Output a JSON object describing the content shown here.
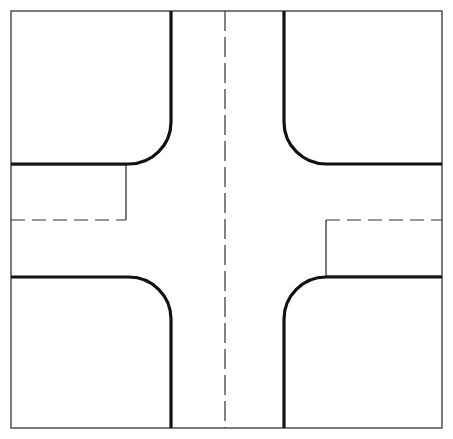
{
  "figure": {
    "type": "engineering-line-drawing",
    "canvas": {
      "width": 453,
      "height": 439
    },
    "background_color": "#ffffff",
    "symmetry": "180-degree rotational"
  },
  "style": {
    "border_color": "#444444",
    "border_width": 1.4,
    "curb_color": "#111111",
    "curb_width": 3.2,
    "thin_color": "#222222",
    "thin_width": 1.2,
    "dash_color": "#333333",
    "dash_width": 1.2,
    "dash_pattern": "20 6",
    "short_dash_pattern": "14 7"
  },
  "geometry": {
    "frame": {
      "left": 11,
      "top": 11,
      "right": 442,
      "bottom": 428
    },
    "centerline_x": 225,
    "roadway": {
      "left_curb_x": 171,
      "right_curb_x": 284,
      "top_curb_y": 164,
      "bottom_curb_y": 277,
      "corner_radius": 42
    },
    "sidewalk_offset_left": {
      "x": 126,
      "y_top": 165,
      "y_bottom": 220
    },
    "sidewalk_offset_right": {
      "x": 326,
      "y_top": 220,
      "y_bottom": 277
    },
    "dashed_lateral_y": 220
  },
  "elements": [
    {
      "name": "outer-frame",
      "kind": "rectangle",
      "stroke": "thin-border"
    },
    {
      "name": "centerline",
      "kind": "dashed-vertical",
      "stroke": "dashed"
    },
    {
      "name": "curb-return-northwest",
      "kind": "rounded-corner",
      "stroke": "curb"
    },
    {
      "name": "curb-return-northeast",
      "kind": "rounded-corner",
      "stroke": "curb"
    },
    {
      "name": "curb-return-southwest",
      "kind": "rounded-corner",
      "stroke": "curb"
    },
    {
      "name": "curb-return-southeast",
      "kind": "rounded-corner",
      "stroke": "curb"
    },
    {
      "name": "offset-line-west",
      "kind": "thin-polyline",
      "stroke": "thin"
    },
    {
      "name": "offset-line-east",
      "kind": "thin-polyline",
      "stroke": "thin"
    },
    {
      "name": "dashed-lateral-west",
      "kind": "dashed-horizontal",
      "stroke": "dashed"
    },
    {
      "name": "dashed-lateral-east",
      "kind": "dashed-horizontal",
      "stroke": "dashed"
    }
  ],
  "paths": {
    "frame_rect": {
      "x": 11,
      "y": 11,
      "w": 431,
      "h": 417
    },
    "centerline": "M 225 11 L 225 428",
    "curb_nw": "M 171 11 L 171 122 A 42 42 0 0 1 129 164 L 11 164",
    "curb_ne": "M 284 11 L 284 122 A 42 42 0 0 0 326 164 L 442 164",
    "curb_sw": "M 11 277 L 129 277 A 42 42 0 0 1 171 319 L 171 428",
    "curb_se": "M 442 277 L 326 277 A 42 42 0 0 0 284 319 L 284 428",
    "offset_west": "M 11 165 L 126 165 L 126 220",
    "offset_east": "M 442 276 L 326 276 L 326 220",
    "dashed_west": "M 11 220 L 126 220",
    "dashed_east": "M 326 220 L 442 220"
  }
}
